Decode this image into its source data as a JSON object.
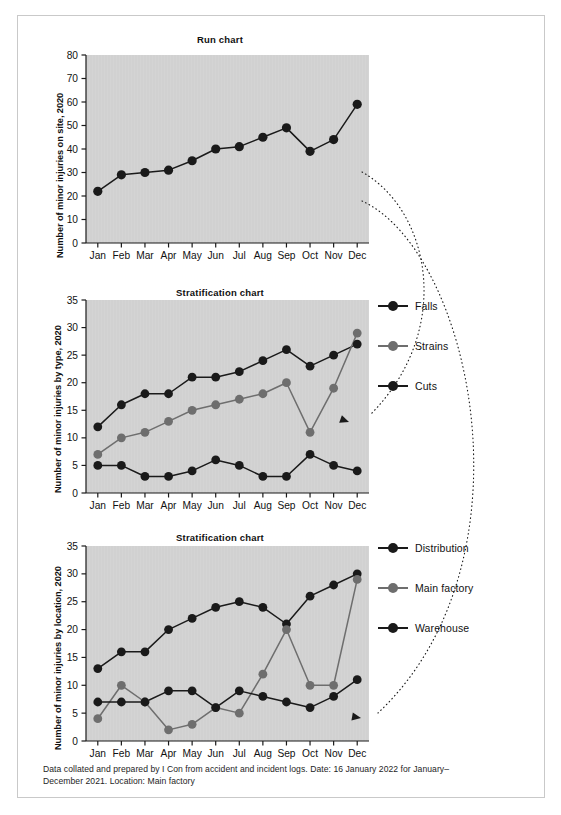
{
  "page": {
    "background": "#ffffff",
    "frame_border_color": "#c9c9c9"
  },
  "colors": {
    "plot_background": "#d4d4d4",
    "series_dark": "#1a1a1a",
    "series_grey": "#6e6e6e",
    "axis": "#1a1a1a",
    "annotation_arrow": "#1a1a1a"
  },
  "caption": {
    "line1": "Data collated and prepared by I Con from accident and incident logs. Date: 16 January 2022 for",
    "line2": "January–December 2021. Location: Main factory"
  },
  "chart_data": [
    {
      "id": "run-chart",
      "type": "line",
      "title": "Run chart",
      "ylabel": "Number of minor injuries on site, 2020",
      "xlabel": "",
      "categories": [
        "Jan",
        "Feb",
        "Mar",
        "Apr",
        "May",
        "Jun",
        "Jul",
        "Aug",
        "Sep",
        "Oct",
        "Nov",
        "Dec"
      ],
      "ylim": [
        0,
        80
      ],
      "yticks": [
        0,
        10,
        20,
        30,
        40,
        50,
        60,
        70,
        80
      ],
      "grid": false,
      "legend": null,
      "series": [
        {
          "name": "Minor injuries on site",
          "color": "#1a1a1a",
          "values": [
            22,
            29,
            30,
            31,
            35,
            40,
            41,
            45,
            49,
            39,
            44,
            59
          ]
        }
      ]
    },
    {
      "id": "stratification-by-type",
      "type": "line",
      "title": "Stratification chart",
      "ylabel": "Number of minor injuries by type, 2020",
      "xlabel": "",
      "categories": [
        "Jan",
        "Feb",
        "Mar",
        "Apr",
        "May",
        "Jun",
        "Jul",
        "Aug",
        "Sep",
        "Oct",
        "Nov",
        "Dec"
      ],
      "ylim": [
        0,
        35
      ],
      "yticks": [
        0,
        5,
        10,
        15,
        20,
        25,
        30,
        35
      ],
      "grid": false,
      "legend_position": "right",
      "series": [
        {
          "name": "Falls",
          "color": "#1a1a1a",
          "values": [
            12,
            16,
            18,
            18,
            21,
            21,
            22,
            24,
            26,
            23,
            25,
            27
          ]
        },
        {
          "name": "Strains",
          "color": "#6e6e6e",
          "values": [
            7,
            10,
            11,
            13,
            15,
            16,
            17,
            18,
            20,
            11,
            19,
            29
          ]
        },
        {
          "name": "Cuts",
          "color": "#1a1a1a",
          "values": [
            5,
            5,
            3,
            3,
            4,
            6,
            5,
            3,
            3,
            7,
            5,
            4
          ]
        }
      ]
    },
    {
      "id": "stratification-by-location",
      "type": "line",
      "title": "Stratification chart",
      "ylabel": "Number of minor injuries by location, 2020",
      "xlabel": "",
      "categories": [
        "Jan",
        "Feb",
        "Mar",
        "Apr",
        "May",
        "Jun",
        "Jul",
        "Aug",
        "Sep",
        "Oct",
        "Nov",
        "Dec"
      ],
      "ylim": [
        0,
        35
      ],
      "yticks": [
        0,
        5,
        10,
        15,
        20,
        25,
        30,
        35
      ],
      "grid": false,
      "legend_position": "right",
      "series": [
        {
          "name": "Distribution",
          "color": "#1a1a1a",
          "values": [
            13,
            16,
            16,
            20,
            22,
            24,
            25,
            24,
            21,
            26,
            28,
            30
          ]
        },
        {
          "name": "Main factory",
          "color": "#6e6e6e",
          "values": [
            4,
            10,
            7,
            2,
            3,
            6,
            5,
            12,
            20,
            10,
            10,
            29
          ]
        },
        {
          "name": "Warehouse",
          "color": "#1a1a1a",
          "values": [
            7,
            7,
            7,
            9,
            9,
            6,
            9,
            8,
            7,
            6,
            8,
            11
          ]
        }
      ]
    }
  ],
  "annotations": [
    {
      "name": "arrow-run-to-type",
      "style": "dotted-curved-arrow"
    },
    {
      "name": "arrow-run-to-location",
      "style": "dotted-curved-arrow"
    }
  ]
}
